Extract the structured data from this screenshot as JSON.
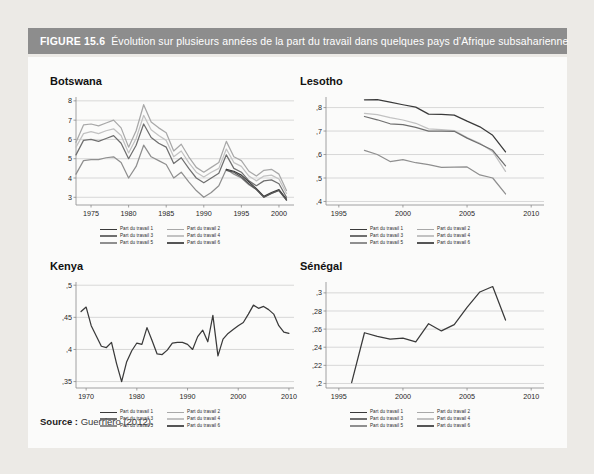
{
  "figure": {
    "number_label": "FIGURE 15.6",
    "caption": "Évolution sur plusieurs années de la part du travail dans quelques pays d’Afrique subsaharienne",
    "source_label": "Source :",
    "source_value": "Guerriero (2012)."
  },
  "colors": {
    "header_bg": "#8d8d8d",
    "header_text": "#ffffff",
    "panel_bg": "#fbfbfa",
    "page_bg": "#eceae6",
    "grid": "#c9c9c9",
    "axis": "#8a8a8a",
    "series": [
      "#3a3a3a",
      "#a8a8a8",
      "#6f6f6f",
      "#c2c2c2",
      "#8f8f8f",
      "#555555"
    ]
  },
  "legend": {
    "items": [
      {
        "label": "Part du travail 1",
        "color": "#3a3a3a"
      },
      {
        "label": "Part du travail 2",
        "color": "#a8a8a8"
      },
      {
        "label": "Part du travail 3",
        "color": "#6f6f6f"
      },
      {
        "label": "Part du travail 4",
        "color": "#c2c2c2"
      },
      {
        "label": "Part du travail 5",
        "color": "#8f8f8f"
      },
      {
        "label": "Part du travail 6",
        "color": "#555555"
      }
    ]
  },
  "chart_data": [
    {
      "id": "botswana",
      "type": "line",
      "title": "Botswana",
      "xlabel": "",
      "ylabel": "",
      "xlim": [
        1973,
        2002
      ],
      "ylim": [
        2.6,
        8.2
      ],
      "xticks": [
        1975,
        1980,
        1985,
        1990,
        1995,
        2000
      ],
      "xticklabels": [
        "1975",
        "1980",
        "1985",
        "1990",
        "1995",
        "2000"
      ],
      "yticks": [
        3,
        4,
        5,
        6,
        7,
        8
      ],
      "yticklabels": [
        "3",
        "4",
        "5",
        "6",
        "7",
        "8"
      ],
      "grid": true,
      "legend_position": "below",
      "x": [
        1973,
        1974,
        1975,
        1976,
        1977,
        1978,
        1979,
        1980,
        1981,
        1982,
        1983,
        1984,
        1985,
        1986,
        1987,
        1988,
        1989,
        1990,
        1991,
        1992,
        1993,
        1994,
        1995,
        1996,
        1997,
        1998,
        1999,
        2000,
        2001
      ],
      "series": [
        {
          "name": "Part du travail 2",
          "color": "#a8a8a8",
          "values": [
            5.85,
            6.75,
            6.8,
            6.7,
            6.85,
            7.0,
            6.6,
            5.6,
            6.45,
            7.8,
            6.9,
            6.6,
            6.35,
            5.4,
            5.75,
            5.1,
            4.55,
            4.3,
            4.55,
            4.8,
            5.9,
            5.1,
            4.9,
            4.35,
            4.1,
            4.4,
            4.45,
            4.2,
            3.35
          ]
        },
        {
          "name": "Part du travail 4",
          "color": "#c2c2c2",
          "values": [
            5.6,
            6.3,
            6.4,
            6.3,
            6.45,
            6.55,
            6.2,
            5.3,
            6.05,
            7.25,
            6.5,
            6.2,
            5.95,
            5.1,
            5.4,
            4.8,
            4.3,
            4.05,
            4.3,
            4.5,
            5.5,
            4.8,
            4.6,
            4.1,
            3.85,
            4.1,
            4.15,
            3.95,
            3.2
          ]
        },
        {
          "name": "Part du travail 3",
          "color": "#6f6f6f",
          "values": [
            5.2,
            5.95,
            6.0,
            5.9,
            6.05,
            6.2,
            5.8,
            5.0,
            5.7,
            6.8,
            6.1,
            5.8,
            5.6,
            4.75,
            5.05,
            4.5,
            4.0,
            3.75,
            4.0,
            4.25,
            5.2,
            4.5,
            4.3,
            3.85,
            3.6,
            3.85,
            3.9,
            3.7,
            3.0
          ]
        },
        {
          "name": "Part du travail 5",
          "color": "#8f8f8f",
          "values": [
            4.2,
            4.9,
            4.95,
            4.95,
            5.05,
            5.1,
            4.8,
            4.0,
            4.6,
            5.7,
            5.1,
            4.9,
            4.7,
            4.0,
            4.3,
            3.8,
            3.35,
            3.0,
            3.25,
            3.6,
            4.45,
            4.2,
            4.0,
            3.65,
            3.4,
            3.0,
            3.2,
            3.35,
            2.85
          ]
        },
        {
          "name": "Part du travail 1",
          "color": "#3a3a3a",
          "values": [
            null,
            null,
            null,
            null,
            null,
            null,
            null,
            null,
            null,
            null,
            null,
            null,
            null,
            null,
            null,
            null,
            null,
            null,
            null,
            null,
            4.45,
            4.35,
            4.15,
            3.8,
            3.45,
            3.05,
            3.25,
            3.4,
            2.9
          ]
        },
        {
          "name": "Part du travail 6",
          "color": "#555555",
          "values": [
            null,
            null,
            null,
            null,
            null,
            null,
            null,
            null,
            null,
            null,
            null,
            null,
            null,
            null,
            null,
            null,
            null,
            null,
            null,
            null,
            4.4,
            4.3,
            4.05,
            3.7,
            3.4,
            3.0,
            3.2,
            3.35,
            2.85
          ]
        }
      ]
    },
    {
      "id": "lesotho",
      "type": "line",
      "title": "Lesotho",
      "xlabel": "",
      "ylabel": "",
      "xlim": [
        1994,
        2011
      ],
      "ylim": [
        0.385,
        0.845
      ],
      "xticks": [
        1995,
        2000,
        2005,
        2010
      ],
      "xticklabels": [
        "1995",
        "2000",
        "2005",
        "2010"
      ],
      "yticks": [
        0.4,
        0.5,
        0.6,
        0.7,
        0.8
      ],
      "yticklabels": [
        ",4",
        ",5",
        ",6",
        ",7",
        ",8"
      ],
      "grid": true,
      "legend_position": "below",
      "x": [
        1997,
        1998,
        1999,
        2000,
        2001,
        2002,
        2003,
        2004,
        2005,
        2006,
        2007,
        2008
      ],
      "series": [
        {
          "name": "Part du travail 1",
          "color": "#3a3a3a",
          "values": [
            0.833,
            0.834,
            0.823,
            0.812,
            0.802,
            0.772,
            0.771,
            0.768,
            0.742,
            0.718,
            0.682,
            0.611
          ]
        },
        {
          "name": "Part du travail 4",
          "color": "#c2c2c2",
          "values": [
            0.775,
            0.77,
            0.757,
            0.747,
            0.733,
            0.709,
            0.706,
            0.702,
            0.672,
            0.648,
            0.612,
            0.528
          ]
        },
        {
          "name": "Part du travail 3",
          "color": "#6f6f6f",
          "values": [
            0.762,
            0.748,
            0.731,
            0.727,
            0.716,
            0.7,
            0.7,
            0.699,
            0.67,
            0.645,
            0.618,
            0.552
          ]
        },
        {
          "name": "Part du travail 5",
          "color": "#8f8f8f",
          "values": [
            0.618,
            0.6,
            0.57,
            0.578,
            0.565,
            0.557,
            0.545,
            0.546,
            0.547,
            0.513,
            0.5,
            0.432
          ]
        }
      ]
    },
    {
      "id": "kenya",
      "type": "line",
      "title": "Kenya",
      "xlabel": "",
      "ylabel": "",
      "xlim": [
        1968,
        2011
      ],
      "ylim": [
        0.34,
        0.505
      ],
      "xticks": [
        1970,
        1980,
        1990,
        2000,
        2010
      ],
      "xticklabels": [
        "1970",
        "1980",
        "1990",
        "2000",
        "2010"
      ],
      "yticks": [
        0.35,
        0.4,
        0.45,
        0.5
      ],
      "yticklabels": [
        ",35",
        ",4",
        ",45",
        ",5"
      ],
      "grid": true,
      "legend_position": "below",
      "x": [
        1969,
        1970,
        1971,
        1972,
        1973,
        1974,
        1975,
        1976,
        1977,
        1978,
        1979,
        1980,
        1981,
        1982,
        1983,
        1984,
        1985,
        1986,
        1987,
        1988,
        1989,
        1990,
        1991,
        1992,
        1993,
        1994,
        1995,
        1996,
        1997,
        1998,
        1999,
        2000,
        2001,
        2002,
        2003,
        2004,
        2005,
        2006,
        2007,
        2008,
        2009,
        2010
      ],
      "series": [
        {
          "name": "Part du travail 1",
          "color": "#3a3a3a",
          "values": [
            0.459,
            0.466,
            0.437,
            0.421,
            0.405,
            0.403,
            0.411,
            0.378,
            0.35,
            0.381,
            0.398,
            0.41,
            0.408,
            0.434,
            0.414,
            0.393,
            0.392,
            0.399,
            0.41,
            0.411,
            0.411,
            0.408,
            0.4,
            0.42,
            0.43,
            0.412,
            0.453,
            0.39,
            0.416,
            0.425,
            0.431,
            0.437,
            0.442,
            0.455,
            0.469,
            0.464,
            0.467,
            0.462,
            0.455,
            0.437,
            0.427,
            0.425
          ]
        }
      ]
    },
    {
      "id": "senegal",
      "type": "line",
      "title": "Sénégal",
      "xlabel": "",
      "ylabel": "",
      "xlim": [
        1994,
        2011
      ],
      "ylim": [
        0.195,
        0.312
      ],
      "xticks": [
        1995,
        2000,
        2005,
        2010
      ],
      "xticklabels": [
        "1995",
        "2000",
        "2005",
        "2010"
      ],
      "yticks": [
        0.2,
        0.22,
        0.24,
        0.26,
        0.28,
        0.3
      ],
      "yticklabels": [
        ",2",
        ",22",
        ",24",
        ",26",
        ",28",
        ",3"
      ],
      "grid": true,
      "legend_position": "below",
      "x": [
        1996,
        1997,
        1998,
        1999,
        2000,
        2001,
        2002,
        2003,
        2004,
        2005,
        2006,
        2007,
        2008
      ],
      "series": [
        {
          "name": "Part du travail 1",
          "color": "#3a3a3a",
          "values": [
            0.201,
            0.256,
            0.252,
            0.249,
            0.25,
            0.246,
            0.266,
            0.258,
            0.265,
            0.284,
            0.301,
            0.307,
            0.27
          ]
        }
      ]
    }
  ]
}
